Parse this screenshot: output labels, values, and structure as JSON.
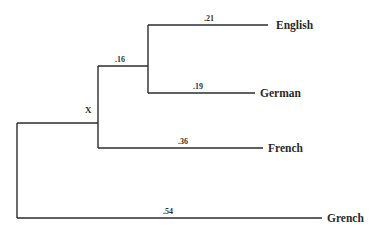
{
  "diagram": {
    "type": "phylogenetic-tree",
    "root_label": "X",
    "leaves": [
      {
        "name": "English",
        "branch_length": ".21"
      },
      {
        "name": "German",
        "branch_length": ".19"
      },
      {
        "name": "French",
        "branch_length": ".36"
      },
      {
        "name": "Grench",
        "branch_length": ".54"
      }
    ],
    "internal_branches": [
      {
        "label": ".16",
        "joins": [
          "English",
          "German"
        ]
      }
    ],
    "line_color": "#2b2b2b"
  }
}
